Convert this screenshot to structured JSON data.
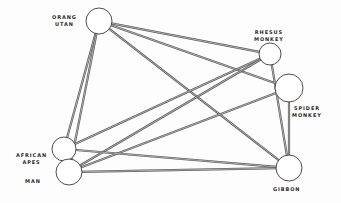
{
  "diagram": {
    "type": "network",
    "nodes": [
      {
        "id": "orang_utan",
        "label_line1": "ORANG",
        "label_line2": "UTAN",
        "cx": 99,
        "cy": 21,
        "r": 13
      },
      {
        "id": "rhesus_monkey",
        "label_line1": "RHESUS",
        "label_line2": "MONKEY",
        "cx": 270,
        "cy": 54,
        "r": 11
      },
      {
        "id": "spider_monkey",
        "label_line1": "SPIDER",
        "label_line2": "MONKEY",
        "cx": 289,
        "cy": 88,
        "r": 14
      },
      {
        "id": "african_apes",
        "label_line1": "AFRICAN",
        "label_line2": "APES",
        "cx": 64,
        "cy": 149,
        "r": 12
      },
      {
        "id": "man",
        "label_line1": "MAN",
        "label_line2": "",
        "cx": 69,
        "cy": 172,
        "r": 13
      },
      {
        "id": "gibbon",
        "label_line1": "GIBBON",
        "label_line2": "",
        "cx": 289,
        "cy": 168,
        "r": 13
      }
    ],
    "edges": [
      {
        "from": "orang_utan",
        "to": "african_apes"
      },
      {
        "from": "orang_utan",
        "to": "man"
      },
      {
        "from": "orang_utan",
        "to": "rhesus_monkey"
      },
      {
        "from": "orang_utan",
        "to": "spider_monkey"
      },
      {
        "from": "orang_utan",
        "to": "gibbon"
      },
      {
        "from": "rhesus_monkey",
        "to": "african_apes"
      },
      {
        "from": "rhesus_monkey",
        "to": "man"
      },
      {
        "from": "rhesus_monkey",
        "to": "gibbon"
      },
      {
        "from": "spider_monkey",
        "to": "man"
      },
      {
        "from": "spider_monkey",
        "to": "gibbon"
      },
      {
        "from": "african_apes",
        "to": "gibbon"
      },
      {
        "from": "man",
        "to": "gibbon"
      }
    ],
    "colors": {
      "background": "#fdfdfd",
      "line": "#5a5a5a",
      "circle_stroke": "#3a3a3a",
      "label": "#2a2a2a"
    }
  },
  "labels": {
    "orang_utan": {
      "line1": "ORANG",
      "line2": "UTAN"
    },
    "rhesus_monkey": {
      "line1": "RHESUS",
      "line2": "MONKEY"
    },
    "spider_monkey": {
      "line1": "SPIDER",
      "line2": "MONKEY"
    },
    "african_apes": {
      "line1": "AFRICAN",
      "line2": "APES"
    },
    "man": {
      "line1": "MAN"
    },
    "gibbon": {
      "line1": "GIBBON"
    }
  }
}
